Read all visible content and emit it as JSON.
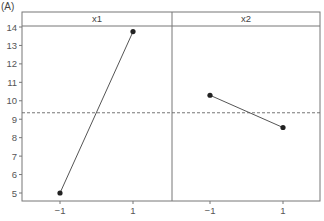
{
  "figure_label": "(A)",
  "chart_data": {
    "type": "line",
    "title": "",
    "xlabel": "",
    "ylabel": "",
    "ylim": [
      4.5,
      14.1
    ],
    "yticks": [
      5,
      6,
      7,
      8,
      9,
      10,
      11,
      12,
      13,
      14
    ],
    "xticks": [
      "−1",
      "1"
    ],
    "grid": false,
    "reference_line": {
      "value": 9.35,
      "style": "dashed"
    },
    "panels": [
      {
        "name": "x1",
        "x": [
          -1,
          1
        ],
        "values": [
          5.0,
          13.75
        ]
      },
      {
        "name": "x2",
        "x": [
          -1,
          1
        ],
        "values": [
          10.3,
          8.55
        ]
      }
    ],
    "colors": {
      "line": "#555555",
      "marker": "#222222",
      "frame": "#777777",
      "axis_text": "#555555"
    }
  }
}
